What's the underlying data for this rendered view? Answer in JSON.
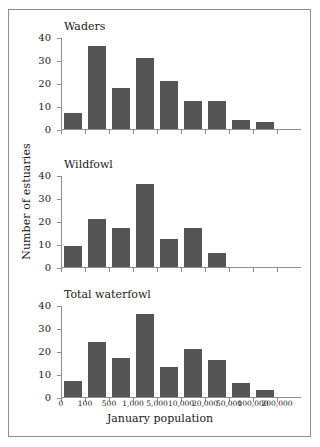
{
  "figure": {
    "width": 320,
    "height": 447,
    "background": "#ffffff",
    "frame_color": "#8e8e8e",
    "bar_color": "#555555"
  },
  "axes": {
    "ylabel": "Number of estuaries",
    "xlabel": "January population",
    "yticks": [
      "40",
      "30",
      "20",
      "10",
      "0"
    ],
    "ylim": [
      0,
      40
    ],
    "xticklabels": [
      "0",
      "100",
      "500",
      "1,000",
      "5,000",
      "10,000",
      "20,000",
      "50,000",
      "100,000",
      "200,000"
    ]
  },
  "panels": [
    {
      "title": "Waders",
      "values": [
        7,
        36,
        18,
        31,
        21,
        12,
        12,
        4,
        3
      ]
    },
    {
      "title": "Wildfowl",
      "values": [
        9,
        21,
        17,
        36,
        12,
        17,
        6,
        0,
        0
      ]
    },
    {
      "title": "Total waterfowl",
      "values": [
        7,
        24,
        17,
        36,
        13,
        21,
        16,
        6,
        3
      ]
    }
  ],
  "chart_data": {
    "type": "bar",
    "title": "",
    "subtitle": "",
    "xlabel": "January population",
    "ylabel": "Number of estuaries",
    "ylim": [
      0,
      40
    ],
    "ytick_values": [
      0,
      10,
      20,
      30,
      40
    ],
    "grid": false,
    "legend": null,
    "bin_edges": [
      "0",
      "100",
      "500",
      "1,000",
      "5,000",
      "10,000",
      "20,000",
      "50,000",
      "100,000",
      "200,000"
    ],
    "bin_labels": [
      "0-100",
      "100-500",
      "500-1,000",
      "1,000-5,000",
      "5,000-10,000",
      "10,000-20,000",
      "20,000-50,000",
      "50,000-100,000",
      "100,000-200,000"
    ],
    "categories": [
      "0-100",
      "100-500",
      "500-1,000",
      "1,000-5,000",
      "5,000-10,000",
      "10,000-20,000",
      "20,000-50,000",
      "50,000-100,000",
      "100,000-200,000"
    ],
    "series": [
      {
        "name": "Waders",
        "values": [
          7,
          36,
          18,
          31,
          21,
          12,
          12,
          4,
          3
        ]
      },
      {
        "name": "Wildfowl",
        "values": [
          9,
          21,
          17,
          36,
          12,
          17,
          6,
          0,
          0
        ]
      },
      {
        "name": "Total waterfowl",
        "values": [
          7,
          24,
          17,
          36,
          13,
          21,
          16,
          6,
          3
        ]
      }
    ]
  }
}
